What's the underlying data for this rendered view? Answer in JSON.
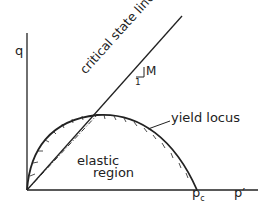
{
  "diagram": {
    "axes": {
      "y_label": "q",
      "x_label": "p′"
    },
    "lines": {
      "critical_state_line": "critical state line",
      "slope_label": "M",
      "slope_run": "1"
    },
    "curves": {
      "yield_locus": "yield locus"
    },
    "regions": {
      "elastic_line1": "elastic",
      "elastic_line2": "region"
    },
    "points": {
      "pc_main": "p",
      "pc_sub": "c"
    }
  }
}
